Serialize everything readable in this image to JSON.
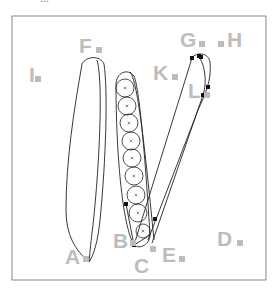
{
  "caption": "...",
  "frame": {
    "x": 12,
    "y": 16,
    "width": 254,
    "height": 264,
    "stroke": "#888888"
  },
  "label_color": "#bdbdbd",
  "labels": [
    {
      "id": "A",
      "text": "A",
      "x": 65,
      "y": 264,
      "sq_x": 83,
      "sq_y": 256
    },
    {
      "id": "B",
      "text": "B",
      "x": 113,
      "y": 248,
      "sq_x": 130,
      "sq_y": 240
    },
    {
      "id": "C",
      "text": "C",
      "x": 134,
      "y": 273,
      "sq_x": 150,
      "sq_y": 246
    },
    {
      "id": "D",
      "text": "D",
      "x": 217,
      "y": 246,
      "sq_x": 237,
      "sq_y": 240
    },
    {
      "id": "E",
      "text": "E",
      "x": 162,
      "y": 262,
      "sq_x": 179,
      "sq_y": 256
    },
    {
      "id": "F",
      "text": "F",
      "x": 79,
      "y": 53,
      "sq_x": 96,
      "sq_y": 47
    },
    {
      "id": "G",
      "text": "G",
      "x": 180,
      "y": 47,
      "sq_x": 199,
      "sq_y": 41
    },
    {
      "id": "H",
      "text": "H",
      "x": 227,
      "y": 47,
      "sq_x": 218,
      "sq_y": 41
    },
    {
      "id": "I",
      "text": "I",
      "x": 29,
      "y": 82,
      "sq_x": 35,
      "sq_y": 76
    },
    {
      "id": "K",
      "text": "K",
      "x": 153,
      "y": 80,
      "sq_x": 172,
      "sq_y": 74
    },
    {
      "id": "L",
      "text": "L",
      "x": 188,
      "y": 98,
      "sq_x": 204,
      "sq_y": 92
    }
  ],
  "circles": [
    {
      "cx": 125,
      "cy": 88,
      "r": 9
    },
    {
      "cx": 127,
      "cy": 106,
      "r": 9
    },
    {
      "cx": 129,
      "cy": 123,
      "r": 9
    },
    {
      "cx": 131,
      "cy": 141,
      "r": 9
    },
    {
      "cx": 132,
      "cy": 158,
      "r": 9
    },
    {
      "cx": 134,
      "cy": 176,
      "r": 9
    },
    {
      "cx": 136,
      "cy": 195,
      "r": 9
    },
    {
      "cx": 138,
      "cy": 213,
      "r": 9
    },
    {
      "cx": 143,
      "cy": 231,
      "r": 7
    }
  ],
  "points": [
    {
      "x": 126,
      "y": 204
    },
    {
      "x": 134,
      "y": 245
    },
    {
      "x": 155,
      "y": 219
    },
    {
      "x": 192,
      "y": 58
    },
    {
      "x": 199,
      "y": 56
    },
    {
      "x": 201,
      "y": 57
    },
    {
      "x": 208,
      "y": 87
    },
    {
      "x": 203,
      "y": 95
    }
  ]
}
